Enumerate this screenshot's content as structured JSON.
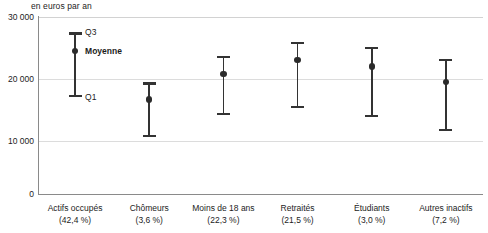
{
  "chart_data": {
    "type": "errorbar",
    "title": "",
    "subtitle": "",
    "unit_caption": "en euros par an",
    "xlabel": "",
    "ylabel": "",
    "ylim": [
      0,
      30000
    ],
    "yticks": [
      0,
      10000,
      20000,
      30000
    ],
    "ytick_labels": [
      "0",
      "10 000",
      "20 000",
      "30 000"
    ],
    "grid": true,
    "gridlines_at": [
      10000,
      20000,
      30000
    ],
    "legend_position": "inline-annotations",
    "annotations": [
      {
        "label": "Q3",
        "refers_to": "upper-quartile-cap",
        "series_index": 0
      },
      {
        "label": "Moyenne",
        "refers_to": "mean-marker",
        "series_index": 0,
        "bold": true
      },
      {
        "label": "Q1",
        "refers_to": "lower-quartile-cap",
        "series_index": 0
      }
    ],
    "categories": [
      "Actifs occupés",
      "Chômeurs",
      "Moins de 18 ans",
      "Retraités",
      "Étudiants",
      "Autres inactifs"
    ],
    "category_shares": [
      "(42,4 %)",
      "(3,6 %)",
      "(22,3 %)",
      "(21,5 %)",
      "(3,0 %)",
      "(7,2 %)"
    ],
    "series": [
      {
        "name": "Moyenne",
        "values": [
          24200,
          16000,
          20300,
          22700,
          21600,
          19000
        ]
      },
      {
        "name": "Q1",
        "values": [
          16400,
          9600,
          13400,
          14500,
          13000,
          10600
        ]
      },
      {
        "name": "Q3",
        "values": [
          27400,
          18900,
          23400,
          25800,
          25000,
          22900
        ]
      }
    ],
    "points": [
      {
        "category": "Actifs occupés",
        "share": "(42,4 %)",
        "q1": 16400,
        "mean": 24200,
        "q3": 27400
      },
      {
        "category": "Chômeurs",
        "share": "(3,6 %)",
        "q1": 9600,
        "mean": 16000,
        "q3": 18900
      },
      {
        "category": "Moins de 18 ans",
        "share": "(22,3 %)",
        "q1": 13400,
        "mean": 20300,
        "q3": 23400
      },
      {
        "category": "Retraités",
        "share": "(21,5 %)",
        "q1": 14500,
        "mean": 22700,
        "q3": 25800
      },
      {
        "category": "Étudiants",
        "share": "(3,0 %)",
        "q1": 13000,
        "mean": 21600,
        "q3": 25000
      },
      {
        "category": "Autres inactifs",
        "share": "(7,2 %)",
        "q1": 10600,
        "mean": 19000,
        "q3": 22900
      }
    ],
    "colors": {
      "marker": "#2b2b2b",
      "whisker": "#333333",
      "grid": "#dcdcdc",
      "axis": "#8a8a8a",
      "text": "#1c1c1c",
      "background": "#ffffff"
    }
  }
}
